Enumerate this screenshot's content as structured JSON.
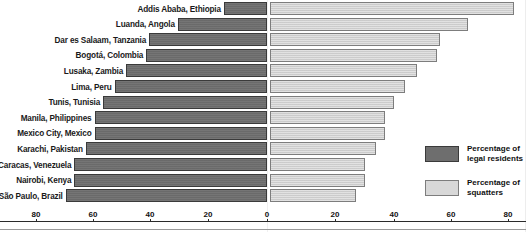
{
  "chart_data": {
    "type": "bar",
    "subtype": "diverging-horizontal-bar",
    "title": "",
    "xlabel": "",
    "ylabel": "",
    "categories": [
      "Addis Ababa, Ethiopia",
      "Luanda, Angola",
      "Dar es Salaam, Tanzania",
      "Bogotá, Colombia",
      "Lusaka, Zambia",
      "Lima, Peru",
      "Tunis, Tunisia",
      "Manila, Philippines",
      "Mexico City, Mexico",
      "Karachi, Pakistan",
      "Caracas, Venezuela",
      "Nairobi, Kenya",
      "São Paulo, Brazil"
    ],
    "series": [
      {
        "name": "Percentage of legal residents",
        "color": "#6e6e6e",
        "direction": "left",
        "values": [
          15,
          31,
          41,
          42,
          49,
          53,
          57,
          60,
          60,
          63,
          67,
          67,
          70
        ]
      },
      {
        "name": "Percentage of squatters",
        "color": "#d2d2d2",
        "direction": "right",
        "values": [
          85,
          69,
          59,
          58,
          51,
          47,
          43,
          40,
          40,
          37,
          33,
          33,
          30
        ]
      }
    ],
    "left_axis_ticks": [
      80,
      60,
      40,
      20,
      0
    ],
    "right_axis_ticks": [
      0,
      20,
      40,
      60,
      80
    ],
    "xlim_left": [
      0,
      80
    ],
    "xlim_right": [
      0,
      80
    ],
    "grid": false,
    "legend_position": "bottom-right"
  },
  "axis": {
    "ticks": [
      {
        "label": "80",
        "x": 36
      },
      {
        "label": "60",
        "x": 93
      },
      {
        "label": "40",
        "x": 150
      },
      {
        "label": "20",
        "x": 208
      },
      {
        "label": "0",
        "x": 267
      },
      {
        "label": "20",
        "x": 335
      },
      {
        "label": "40",
        "x": 394
      },
      {
        "label": "60",
        "x": 451
      },
      {
        "label": "80",
        "x": 508
      }
    ]
  },
  "legend": {
    "items": [
      {
        "swatch": "dark",
        "line1": "Percentage of",
        "line2": "legal residents"
      },
      {
        "swatch": "light",
        "line1": "Percentage of",
        "line2": "squatters"
      }
    ]
  }
}
